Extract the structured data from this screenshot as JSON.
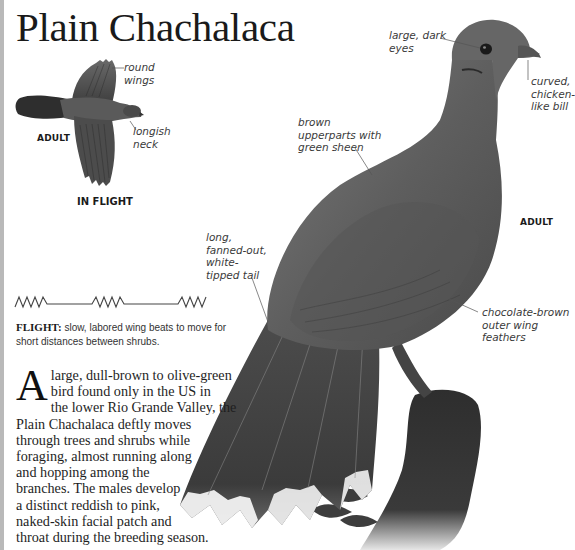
{
  "page": {
    "title": "Plain Chachalaca",
    "left_border_color": "#b9b9b9"
  },
  "flight_illustration": {
    "age_label": "ADULT",
    "caption": "IN FLIGHT",
    "callouts": {
      "wings": "round\nwings",
      "neck": "longish\nneck"
    }
  },
  "flight_pattern": {
    "icon": "zigzag-glide-flight-pattern-icon",
    "label": "FLIGHT:",
    "description": " slow, labored wing beats to move for short distances between shrubs."
  },
  "main_illustration": {
    "age_label": "ADULT",
    "callouts": {
      "eyes": "large, dark\neyes",
      "bill": "curved,\nchicken-\nlike bill",
      "upperparts": "brown\nupperparts with\ngreen sheen",
      "tail": "long,\nfanned-out,\nwhite-\ntipped tail",
      "wing_feathers": "chocolate-brown\nouter wing\nfeathers"
    }
  },
  "description": {
    "dropcap": "A",
    "lines": [
      "large, dull-brown to olive-green",
      "bird found only in the US in",
      "the lower Rio Grande Valley, the",
      "Plain Chachalaca deftly moves",
      "through trees and shrubs while",
      "foraging, almost running along",
      "and hopping among the",
      "branches. The males develop",
      "a distinct reddish to pink,",
      "naked-skin facial patch and",
      "throat during the breeding season."
    ]
  }
}
